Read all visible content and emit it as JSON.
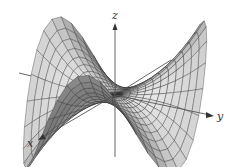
{
  "figure": {
    "type": "3d-surface-wireframe",
    "axes": {
      "x": {
        "label": "x"
      },
      "y": {
        "label": "y"
      },
      "z": {
        "label": "z"
      }
    },
    "colors": {
      "surface_light": "#d8d8d8",
      "surface_dark": "#7a7a7a",
      "mesh": "#2a2a2a",
      "axis": "#555555"
    }
  }
}
